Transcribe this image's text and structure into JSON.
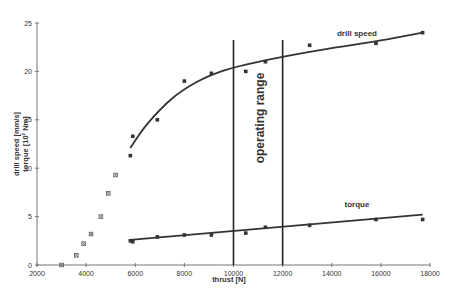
{
  "chart_data": {
    "type": "scatter",
    "title": "",
    "xlabel": "thrust [N]",
    "ylabel": "drill speed [mm/s]\ntorque [10^2 Nm]",
    "ylabel_lines": [
      "drill speed [mm/s]",
      "torque [10² Nm]"
    ],
    "xlim": [
      2000,
      18000
    ],
    "ylim": [
      0,
      25
    ],
    "x_ticks": [
      2000,
      4000,
      6000,
      8000,
      10000,
      12000,
      14000,
      16000,
      18000
    ],
    "y_ticks": [
      0,
      5,
      10,
      15,
      20,
      25
    ],
    "grid": false,
    "legend": "none (inline labels)",
    "annotations": [
      {
        "text": "drill speed",
        "x": 15200,
        "y": 24.6
      },
      {
        "text": "torque",
        "x": 14000,
        "y": 6.3
      },
      {
        "text": "operating range",
        "x": 11000,
        "y": 15,
        "rotation": -90
      }
    ],
    "vertical_lines": [
      10000,
      12000
    ],
    "series": [
      {
        "name": "initial penetration",
        "marker": "x",
        "points": [
          [
            3000,
            0
          ],
          [
            3600,
            1
          ],
          [
            3900,
            2.2
          ],
          [
            4200,
            3.2
          ],
          [
            4600,
            5
          ],
          [
            4900,
            7.4
          ],
          [
            5200,
            9.3
          ]
        ]
      },
      {
        "name": "drill speed",
        "marker": "square",
        "points": [
          [
            5800,
            11.3
          ],
          [
            5900,
            13.3
          ],
          [
            6900,
            15
          ],
          [
            8000,
            19
          ],
          [
            9100,
            19.8
          ],
          [
            10500,
            20
          ],
          [
            11300,
            21
          ],
          [
            13100,
            22.7
          ],
          [
            15800,
            22.9
          ],
          [
            17700,
            24
          ]
        ],
        "fit": [
          [
            5800,
            12.1
          ],
          [
            6500,
            14.6
          ],
          [
            7500,
            17.2
          ],
          [
            8500,
            18.9
          ],
          [
            9500,
            20.0
          ],
          [
            10500,
            20.7
          ],
          [
            12000,
            21.5
          ],
          [
            14000,
            22.4
          ],
          [
            16000,
            23.2
          ],
          [
            17700,
            24
          ]
        ]
      },
      {
        "name": "torque",
        "marker": "square",
        "points": [
          [
            5800,
            2.5
          ],
          [
            5900,
            2.4
          ],
          [
            6900,
            2.9
          ],
          [
            8000,
            3.1
          ],
          [
            9100,
            3.1
          ],
          [
            10500,
            3.3
          ],
          [
            11300,
            3.9
          ],
          [
            13100,
            4.1
          ],
          [
            15800,
            4.7
          ],
          [
            17700,
            4.7
          ]
        ],
        "fit": [
          [
            5800,
            2.6
          ],
          [
            17700,
            5.2
          ]
        ]
      }
    ]
  },
  "labels": {
    "xlabel": "thrust [N]",
    "ylabel_1": "drill speed [mm/s]",
    "ylabel_2": "torque [10² Nm]",
    "drill_speed": "drill speed",
    "torque": "torque",
    "operating_range": "operating range"
  }
}
